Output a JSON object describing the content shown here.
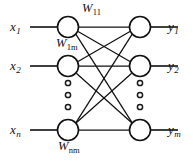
{
  "diagram": {
    "colors": {
      "stroke": "#111111",
      "background": "#ffffff",
      "node_fill": "#ffffff"
    },
    "input_layer": {
      "name": "input-layer",
      "nodes": [
        {
          "id": "x1",
          "base": "x",
          "sub": "1",
          "cx": 68,
          "cy": 27,
          "r": 10.5,
          "lead_x": 30
        },
        {
          "id": "x2",
          "base": "x",
          "sub": "2",
          "cx": 68,
          "cy": 66,
          "r": 10.5,
          "lead_x": 30
        },
        {
          "id": "xn",
          "base": "x",
          "sub": "n",
          "cx": 68,
          "cy": 130,
          "r": 10.5,
          "lead_x": 30
        }
      ],
      "labels": [
        {
          "text": "x",
          "sub": "1",
          "x": 10,
          "y": 20
        },
        {
          "text": "x",
          "sub": "2",
          "x": 10,
          "y": 59
        },
        {
          "text": "x",
          "sub": "n",
          "x": 10,
          "y": 123
        }
      ],
      "ellipsis": {
        "cx": 68,
        "dots_y": [
          83,
          95,
          107
        ],
        "r": 2.6
      }
    },
    "output_layer": {
      "name": "output-layer",
      "nodes": [
        {
          "id": "y1",
          "base": "y",
          "sub": "1",
          "cx": 140,
          "cy": 27,
          "r": 10.5,
          "lead_x": 178
        },
        {
          "id": "y2",
          "base": "y",
          "sub": "2",
          "cx": 140,
          "cy": 66,
          "r": 10.5,
          "lead_x": 178
        },
        {
          "id": "ym",
          "base": "y",
          "sub": "m",
          "cx": 140,
          "cy": 130,
          "r": 10.5,
          "lead_x": 178
        }
      ],
      "labels": [
        {
          "text": "y",
          "sub": "1",
          "x": 168,
          "y": 20
        },
        {
          "text": "y",
          "sub": "2",
          "x": 168,
          "y": 59
        },
        {
          "text": "y",
          "sub": "m",
          "x": 168,
          "y": 123
        }
      ],
      "ellipsis": {
        "cx": 140,
        "dots_y": [
          83,
          95,
          107
        ],
        "r": 2.6
      }
    },
    "weight_labels": [
      {
        "id": "w11",
        "text": "W",
        "sub": "11",
        "x": 82,
        "y": 2
      },
      {
        "id": "w1m",
        "text": "W",
        "sub": "1m",
        "x": 56,
        "y": 37
      },
      {
        "id": "wnm",
        "text": "W",
        "sub": "nm",
        "x": 58,
        "y": 140
      }
    ],
    "edges": [
      {
        "from": "x1",
        "to": "y1"
      },
      {
        "from": "x1",
        "to": "y2"
      },
      {
        "from": "x1",
        "to": "ym"
      },
      {
        "from": "x2",
        "to": "y1"
      },
      {
        "from": "x2",
        "to": "y2"
      },
      {
        "from": "x2",
        "to": "ym"
      },
      {
        "from": "xn",
        "to": "y1"
      },
      {
        "from": "xn",
        "to": "y2"
      },
      {
        "from": "xn",
        "to": "ym"
      }
    ]
  }
}
